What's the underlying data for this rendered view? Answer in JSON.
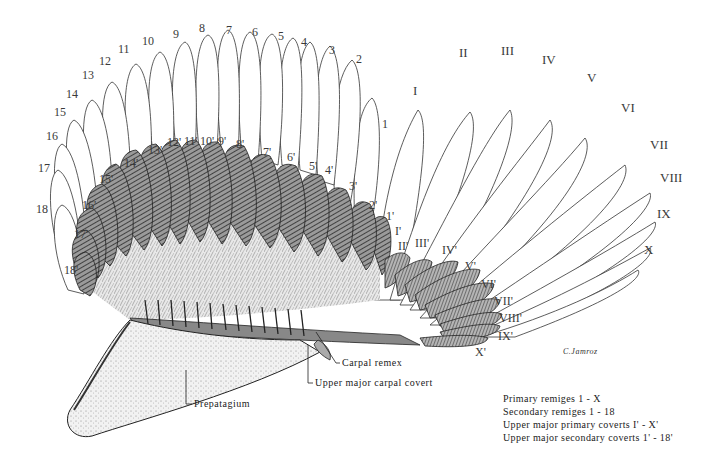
{
  "figure": {
    "signature": "C.Jamroz"
  },
  "primary_remiges": {
    "labels": [
      "I",
      "II",
      "III",
      "IV",
      "V",
      "VI",
      "VII",
      "VIII",
      "IX",
      "X"
    ]
  },
  "secondary_remiges": {
    "labels": [
      "1",
      "2",
      "3",
      "4",
      "5",
      "6",
      "7",
      "8",
      "9",
      "10",
      "11",
      "12",
      "13",
      "14",
      "15",
      "16",
      "17",
      "18"
    ]
  },
  "upper_major_primary_coverts": {
    "labels": [
      "I'",
      "II'",
      "III'",
      "IV'",
      "V'",
      "VI'",
      "VII'",
      "VIII'",
      "IX'",
      "X'"
    ]
  },
  "upper_major_secondary_coverts": {
    "labels": [
      "1'",
      "2'",
      "3'",
      "4'",
      "5'",
      "6'",
      "7'",
      "8'",
      "9'",
      "10'",
      "11'",
      "12'",
      "13'",
      "14'",
      "15'",
      "16'",
      "17'",
      "18'"
    ]
  },
  "callouts": {
    "carpal_remex": "Carpal remex",
    "upper_major_carpal_covert": "Upper major carpal covert",
    "prepatagium": "Prepatagium"
  },
  "legend": {
    "items": [
      "Primary remiges  1 - X",
      "Secondary remiges  1 - 18",
      "Upper major primary coverts  I' - X'",
      "Upper major secondary coverts  1' - 18'"
    ]
  },
  "colors": {
    "ink": "#2a2a2a",
    "paper": "#ffffff",
    "shade": "#555555"
  }
}
